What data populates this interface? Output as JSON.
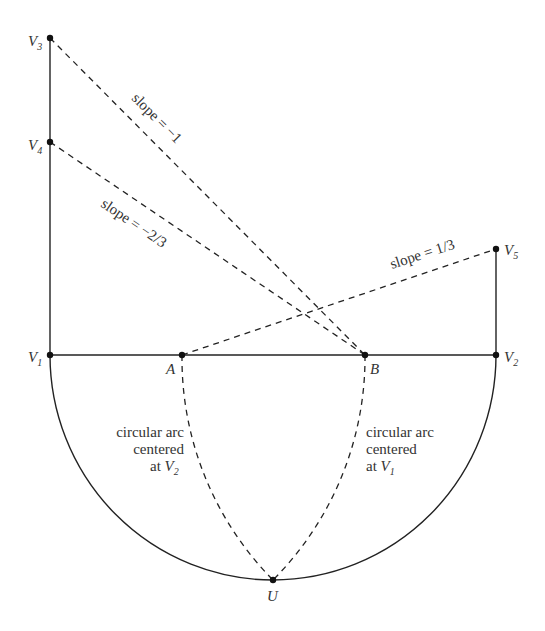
{
  "diagram": {
    "points": {
      "V1": {
        "label": "V",
        "sub": "1",
        "x": 50,
        "y": 355
      },
      "V2": {
        "label": "V",
        "sub": "2",
        "x": 496,
        "y": 355
      },
      "V3": {
        "label": "V",
        "sub": "3",
        "x": 50,
        "y": 38
      },
      "V4": {
        "label": "V",
        "sub": "4",
        "x": 50,
        "y": 142
      },
      "V5": {
        "label": "V",
        "sub": "5",
        "x": 496,
        "y": 249
      },
      "A": {
        "label": "A",
        "x": 182,
        "y": 355
      },
      "B": {
        "label": "B",
        "x": 365,
        "y": 355
      },
      "U": {
        "label": "U",
        "x": 273,
        "y": 580
      }
    },
    "slope_labels": {
      "v3b": "slope = −1",
      "v4b": "slope = −2/3",
      "av5": "slope = 1/3"
    },
    "arc_labels": {
      "left": {
        "line1": "circular arc",
        "line2": "centered",
        "line3": "at ",
        "var": "V",
        "sub": "2"
      },
      "right": {
        "line1": "circular arc",
        "line2": "centered",
        "line3": "at ",
        "var": "V",
        "sub": "1"
      }
    }
  }
}
